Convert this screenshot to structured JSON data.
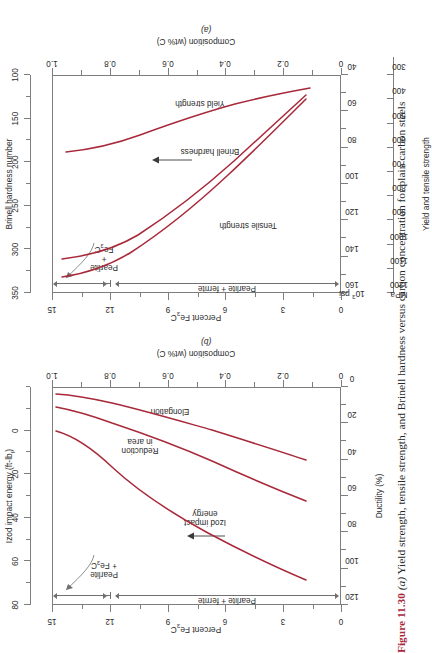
{
  "caption": {
    "figure_number": "Figure 11.30",
    "part_a_marker": "(a)",
    "text": " Yield strength, tensile strength, and Brinell hardness versus carbon concentration for plain carbon steels"
  },
  "panel_a": {
    "id": "(a)",
    "x_axis": {
      "label": "Composition (wt% C)",
      "ticks": [
        "0",
        "0.2",
        "0.4",
        "0.6",
        "0.8",
        "1.0"
      ]
    },
    "top_axis": {
      "label": "Percent Fe3C",
      "ticks": [
        "0",
        "3",
        "6",
        "9",
        "12",
        "15"
      ]
    },
    "left_axis": {
      "label": "Brinell hardness number",
      "ticks": [
        "100",
        "150",
        "200",
        "250",
        "300",
        "350"
      ]
    },
    "right_axis_psi": {
      "label": "103 psi",
      "ticks": [
        "40",
        "60",
        "80",
        "100",
        "120",
        "140",
        "160"
      ]
    },
    "right_axis_mpa": {
      "label": "MPa",
      "ticks": [
        "300",
        "400",
        "500",
        "600",
        "700",
        "800",
        "900",
        "1000",
        "1100",
        "1200"
      ]
    },
    "outer_label": "Yield and tensile strength",
    "curve_labels": [
      "Tensile strength",
      "Brinell hardness",
      "Yield strength"
    ],
    "region_labels": [
      "Pearlite + ferrite",
      "Pearlite + Fe3C"
    ]
  },
  "panel_b": {
    "id": "(b)",
    "x_axis": {
      "label": "Composition (wt% C)",
      "ticks": [
        "0",
        "0.2",
        "0.4",
        "0.6",
        "0.8",
        "1.0"
      ]
    },
    "top_axis": {
      "label": "Percent Fe3C",
      "ticks": [
        "0",
        "3",
        "6",
        "9",
        "12",
        "15"
      ]
    },
    "left_axis": {
      "label": "Ductility (%)",
      "ticks": [
        "0",
        "20",
        "40",
        "60",
        "80",
        "100",
        "120"
      ]
    },
    "right_axis_izod": {
      "label": "Izod impact energy (ft-lbf)",
      "ticks": [
        "0",
        "20",
        "40",
        "60",
        "80"
      ]
    },
    "curve_labels": [
      "Izod impact energy",
      "Reduction in area",
      "Elongation"
    ],
    "region_labels": [
      "Pearlite + ferrite",
      "Pearlite + Fe3C"
    ]
  },
  "colors": {
    "curve": "#a8293a",
    "axis": "#7d7d7d",
    "text": "#2b2b2b",
    "figure_number": "#a8293a"
  },
  "chart_data": [
    {
      "type": "line",
      "title": "(a) Yield strength, tensile strength, and Brinell hardness vs carbon concentration",
      "xlabel": "Composition (wt% C)",
      "ylabel": "Yield and tensile strength (MPa) / 10^3 psi / Brinell hardness number",
      "xlim": [
        0,
        1.0
      ],
      "x_ticks": [
        0,
        0.2,
        0.4,
        0.6,
        0.8,
        1.0
      ],
      "secondary_xaxis": {
        "label": "Percent Fe3C",
        "lim": [
          0,
          15
        ],
        "ticks": [
          0,
          3,
          6,
          9,
          12,
          15
        ]
      },
      "y_axes": [
        {
          "name": "Yield and tensile strength (MPa)",
          "lim": [
            300,
            1200
          ],
          "ticks": [
            300,
            400,
            500,
            600,
            700,
            800,
            900,
            1000,
            1100,
            1200
          ]
        },
        {
          "name": "10^3 psi",
          "lim": [
            40,
            160
          ],
          "ticks": [
            40,
            60,
            80,
            100,
            120,
            140,
            160
          ]
        },
        {
          "name": "Brinell hardness number",
          "lim": [
            100,
            350
          ],
          "ticks": [
            100,
            150,
            200,
            250,
            300,
            350
          ]
        }
      ],
      "grid": false,
      "legend": "in-plot curve labels",
      "series": [
        {
          "name": "Tensile strength",
          "unit": "MPa",
          "x": [
            0.12,
            0.2,
            0.3,
            0.4,
            0.5,
            0.6,
            0.7,
            0.8,
            0.9,
            0.95
          ],
          "values": [
            415,
            470,
            545,
            625,
            700,
            780,
            855,
            935,
            1010,
            1050
          ]
        },
        {
          "name": "Brinell hardness",
          "unit": "Brinell hardness number",
          "x": [
            0.12,
            0.2,
            0.3,
            0.4,
            0.5,
            0.6,
            0.7,
            0.8,
            0.9,
            0.95
          ],
          "values": [
            120,
            133,
            152,
            172,
            193,
            215,
            237,
            258,
            278,
            288
          ]
        },
        {
          "name": "Yield strength",
          "unit": "MPa",
          "x": [
            0.12,
            0.2,
            0.3,
            0.4,
            0.5,
            0.6,
            0.7,
            0.8,
            0.9,
            0.95
          ],
          "values": [
            290,
            305,
            325,
            345,
            370,
            395,
            425,
            460,
            500,
            520
          ]
        }
      ],
      "annotations": [
        "Pearlite + ferrite",
        "Pearlite + Fe3C",
        "Tensile strength",
        "Brinell hardness",
        "Yield strength"
      ]
    },
    {
      "type": "line",
      "title": "(b) Ductility and Izod impact energy vs carbon concentration",
      "xlabel": "Composition (wt% C)",
      "ylabel": "Ductility (%) / Izod impact energy (ft-lbf)",
      "xlim": [
        0,
        1.0
      ],
      "x_ticks": [
        0,
        0.2,
        0.4,
        0.6,
        0.8,
        1.0
      ],
      "secondary_xaxis": {
        "label": "Percent Fe3C",
        "lim": [
          0,
          15
        ],
        "ticks": [
          0,
          3,
          6,
          9,
          12,
          15
        ]
      },
      "y_axes": [
        {
          "name": "Ductility (%)",
          "lim": [
            0,
            120
          ],
          "ticks": [
            0,
            20,
            40,
            60,
            80,
            100,
            120
          ]
        },
        {
          "name": "Izod impact energy (ft-lbf)",
          "lim": [
            0,
            90
          ],
          "ticks": [
            0,
            20,
            40,
            60,
            80
          ]
        }
      ],
      "grid": false,
      "legend": "in-plot curve labels",
      "series": [
        {
          "name": "Izod impact energy",
          "unit": "ft-lbf",
          "x": [
            0.12,
            0.2,
            0.3,
            0.4,
            0.5,
            0.6,
            0.7,
            0.8,
            0.9,
            0.95
          ],
          "values": [
            86,
            72,
            56,
            43,
            32,
            23,
            15,
            9,
            6,
            5
          ]
        },
        {
          "name": "Reduction in area",
          "unit": "%",
          "x": [
            0.12,
            0.2,
            0.3,
            0.4,
            0.5,
            0.6,
            0.7,
            0.8,
            0.9,
            0.95
          ],
          "values": [
            68,
            62,
            54,
            46,
            40,
            34,
            29,
            25,
            22,
            21
          ]
        },
        {
          "name": "Elongation",
          "unit": "%",
          "x": [
            0.12,
            0.2,
            0.3,
            0.4,
            0.5,
            0.6,
            0.7,
            0.8,
            0.9,
            0.95
          ],
          "values": [
            39,
            34,
            28,
            24,
            21,
            18,
            15,
            13,
            11,
            10
          ]
        }
      ],
      "annotations": [
        "Pearlite + ferrite",
        "Pearlite + Fe3C",
        "Izod impact energy",
        "Reduction in area",
        "Elongation"
      ]
    }
  ]
}
